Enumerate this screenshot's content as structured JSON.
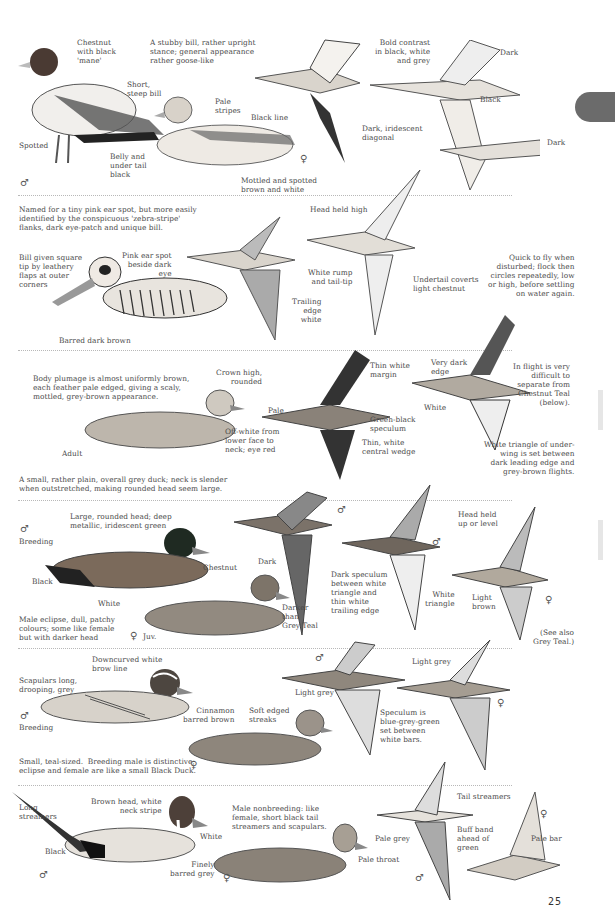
{
  "page": {
    "number": "25",
    "thumb_tab_color": "#6b6b6b",
    "divider_color": "#b8b8b8"
  },
  "sections": [
    {
      "id": "musk-goose-like",
      "labels": {
        "chestnut_mane": "Chestnut\nwith black\n'mane'",
        "intro": "A stubby bill, rather upright\nstance; general appearance\nrather goose-like",
        "short_bill": "Short,\nsteep bill",
        "pale_stripes": "Pale\nstripes",
        "black_line": "Black line",
        "spotted": "Spotted",
        "belly": "Belly and\nunder tail\nblack",
        "mottled": "Mottled and spotted\nbrown and white",
        "bold_contrast": "Bold contrast\nin black, white\nand grey",
        "dark1": "Dark",
        "black": "Black",
        "dark2": "Dark",
        "iridescent": "Dark, iridescent\ndiagonal"
      },
      "symbols": {
        "male": "♂",
        "female": "♀"
      }
    },
    {
      "id": "pink-eared",
      "labels": {
        "intro": "Named for a tiny pink ear spot, but more easily\nidentified by the conspicuous 'zebra-stripe'\nflanks, dark eye-patch and unique bill.",
        "bill": "Bill given square\ntip by leathery\nflaps at outer\ncorners",
        "pink_spot": "Pink ear spot\nbeside dark\neye",
        "barred": "Barred dark brown",
        "head_high": "Head held high",
        "white_rump": "White rump\nand tail-tip",
        "trailing": "Trailing\nedge\nwhite",
        "undertail": "Undertail coverts\nlight chestnut",
        "quick_fly": "Quick to fly when\ndisturbed; flock then\ncircles repeatedly, low\nor high, before settling\non water again."
      }
    },
    {
      "id": "grey-teal",
      "labels": {
        "body_plumage": "Body plumage is almost uniformly brown,\neach feather pale edged, giving a scaly,\nmottled, grey-brown appearance.",
        "crown": "Crown high,\nrounded",
        "offwhite": "Off-white from\nlower face to\nneck; eye red",
        "adult": "Adult",
        "summary": "A small, rather plain, overall grey duck; neck is slender\nwhen outstretched, making rounded head seem large.",
        "pale": "Pale",
        "thin_margin": "Thin white\nmargin",
        "green_black": "Green-black\nspeculum",
        "central_wedge": "Thin, white\ncentral wedge",
        "very_dark": "Very dark\nedge",
        "white": "White",
        "in_flight": "In flight is very\ndifficult to\nseparate from\nChestnut Teal\n(below).",
        "triangle": "White triangle of under-\nwing is set between\ndark leading edge and\ngrey-brown flights."
      }
    },
    {
      "id": "chestnut-teal",
      "labels": {
        "breeding": "Breeding",
        "large_head": "Large, rounded head; deep\nmetallic, iridescent green",
        "chestnut": "Chestnut",
        "black": "Black",
        "white": "White",
        "eclipse": "Male eclipse, dull, patchy\ncolours; some like female\nbut with darker head",
        "juv": "Juv.",
        "dark": "Dark",
        "darker": "Darker\nthan\nGrey Teal",
        "dark_speculum": "Dark speculum\nbetween white\ntriangle and\nthin white\ntrailing edge",
        "white_triangle": "White\ntriangle",
        "head_level": "Head held\nup or level",
        "light_brown": "Light\nbrown",
        "see_also": "(See also\nGrey Teal.)"
      }
    },
    {
      "id": "garganey",
      "labels": {
        "brow": "Downcurved white\nbrow line",
        "scapulars": "Scapulars long,\ndrooping, grey",
        "cinnamon": "Cinnamon\nbarred brown",
        "breeding": "Breeding",
        "soft_streaks": "Soft edged\nstreaks",
        "summary": "Small, teal-sized.  Breeding male is distinctive;\neclipse and female are like a small Black Duck.",
        "light_grey1": "Light grey",
        "light_grey2": "Light grey",
        "speculum": "Speculum is\nblue-grey-green\nset between\nwhite bars."
      }
    },
    {
      "id": "pintail",
      "labels": {
        "long_streamers": "Long\nstreamers",
        "brown_head": "Brown head, white\nneck stripe",
        "white": "White",
        "black": "Black",
        "finely": "Finely\nbarred grey",
        "nonbreeding": "Male nonbreeding: like\nfemale, short black tail\nstreamers and scapulars.",
        "pale_throat": "Pale throat",
        "tail_streamers": "Tail streamers",
        "pale_grey": "Pale grey",
        "buff_band": "Buff band\nahead of\ngreen",
        "pale_bar": "Pale bar"
      }
    }
  ]
}
